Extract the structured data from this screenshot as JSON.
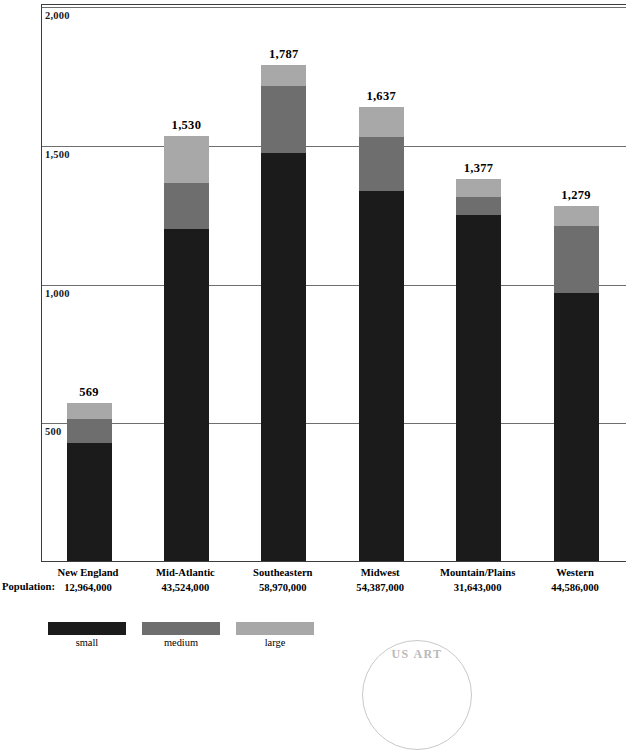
{
  "chart_data": {
    "type": "bar",
    "subtype": "stacked-bar",
    "title": "",
    "xlabel": "",
    "ylabel": "",
    "ylim": [
      0,
      2000
    ],
    "yticks": [
      500,
      1000,
      1500,
      2000
    ],
    "ytick_labels": [
      "500",
      "1,000",
      "1,500",
      "2,000"
    ],
    "grid": true,
    "legend_position": "bottom-left",
    "categories": [
      "New England",
      "Mid-Atlantic",
      "Southeastern",
      "Midwest",
      "Mountain/Plains",
      "Western"
    ],
    "totals": [
      569,
      1530,
      1787,
      1637,
      1377,
      1279
    ],
    "total_labels": [
      "569",
      "1,530",
      "1,787",
      "1,637",
      "1,377",
      "1,279"
    ],
    "series": [
      {
        "name": "small",
        "color": "#1b1b1b",
        "values": [
          424,
          1198,
          1471,
          1334,
          1248,
          967
        ]
      },
      {
        "name": "medium",
        "color": "#6e6e6e",
        "values": [
          86,
          165,
          241,
          194,
          65,
          241
        ]
      },
      {
        "name": "large",
        "color": "#a8a8a8",
        "values": [
          59,
          167,
          75,
          109,
          64,
          71
        ]
      }
    ],
    "population_caption": "Population:",
    "population_labels": [
      "12,964,000",
      "43,524,000",
      "58,970,000",
      "54,387,000",
      "31,643,000",
      "44,586,000"
    ],
    "legend": [
      {
        "label": "small",
        "color": "#1b1b1b"
      },
      {
        "label": "medium",
        "color": "#6e6e6e"
      },
      {
        "label": "large",
        "color": "#a8a8a8"
      }
    ]
  },
  "watermark": {
    "text": "US ART"
  }
}
